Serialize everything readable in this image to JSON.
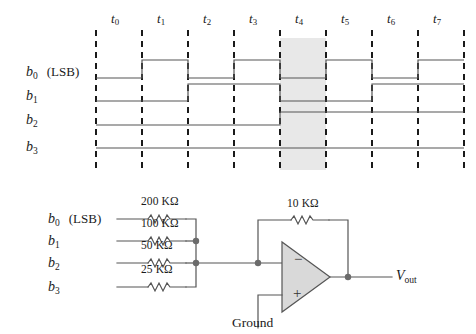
{
  "figure": {
    "kind": "dac-timing-and-circuit",
    "colors": {
      "line": "#4d4d4d",
      "dash": "#1a1a1a",
      "shade": "#e6e6e6",
      "opamp_fill": "#d9d9d9",
      "text": "#1a1a1a",
      "node": "#666666"
    }
  },
  "timing": {
    "time_labels": [
      "t0",
      "t1",
      "t2",
      "t3",
      "t4",
      "t5",
      "t6",
      "t7"
    ],
    "time_label_base": "t",
    "time_label_subs": [
      "0",
      "1",
      "2",
      "3",
      "4",
      "5",
      "6",
      "7"
    ],
    "highlight_interval": "t4",
    "signals": [
      {
        "name": "b0",
        "base": "b",
        "sub": "0",
        "annotation": "(LSB)",
        "values": [
          0,
          1,
          0,
          1,
          0,
          1,
          0,
          1
        ]
      },
      {
        "name": "b1",
        "base": "b",
        "sub": "1",
        "annotation": "",
        "values": [
          0,
          0,
          1,
          1,
          0,
          0,
          1,
          1
        ]
      },
      {
        "name": "b2",
        "base": "b",
        "sub": "2",
        "annotation": "",
        "values": [
          0,
          0,
          0,
          0,
          1,
          1,
          1,
          1
        ]
      },
      {
        "name": "b3",
        "base": "b",
        "sub": "3",
        "annotation": "",
        "values": [
          0,
          0,
          0,
          0,
          0,
          0,
          0,
          0
        ]
      }
    ]
  },
  "circuit": {
    "inputs": [
      {
        "base": "b",
        "sub": "0",
        "annotation": "(LSB)",
        "resistor": "200 KΩ"
      },
      {
        "base": "b",
        "sub": "1",
        "annotation": "",
        "resistor": "100 KΩ"
      },
      {
        "base": "b",
        "sub": "2",
        "annotation": "",
        "resistor": "50 KΩ"
      },
      {
        "base": "b",
        "sub": "3",
        "annotation": "",
        "resistor": "25 KΩ"
      }
    ],
    "feedback_resistor": "10 KΩ",
    "opamp": {
      "inverting_label": "−",
      "noninverting_label": "+"
    },
    "ground_label": "Ground",
    "output": {
      "base": "V",
      "sub": "out"
    }
  }
}
